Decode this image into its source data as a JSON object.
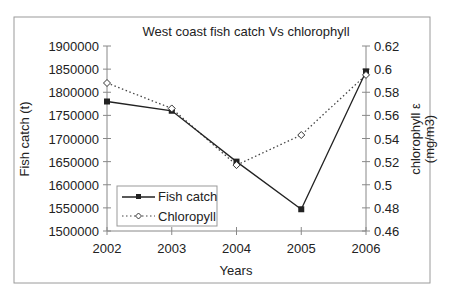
{
  "chart_data": {
    "type": "line",
    "title": "West coast fish catch Vs chlorophyll",
    "xlabel": "Years",
    "ylabel": "Fish catch (t)",
    "y2label_line1": "chlorophyll ε",
    "y2label_line2": "(mg/m3)",
    "categories": [
      "2002",
      "2003",
      "2004",
      "2005",
      "2006"
    ],
    "ylim": [
      1500000,
      1900000
    ],
    "yticks": [
      "1500000",
      "1550000",
      "1600000",
      "1650000",
      "1700000",
      "1750000",
      "1800000",
      "1850000",
      "1900000"
    ],
    "y2lim": [
      0.46,
      0.62
    ],
    "y2ticks": [
      "0.46",
      "0.48",
      "0.5",
      "0.52",
      "0.54",
      "0.56",
      "0.58",
      "0.6",
      "0.62"
    ],
    "grid": false,
    "legend_position": "bottom-left",
    "series": [
      {
        "name": "Fish catch",
        "axis": "left",
        "style": "solid",
        "marker": "filled-square",
        "values": [
          1780000,
          1760000,
          1650000,
          1547000,
          1845000
        ]
      },
      {
        "name": "Chloropyll",
        "axis": "right",
        "style": "dotted",
        "marker": "open-diamond",
        "values": [
          0.588,
          0.566,
          0.517,
          0.543,
          0.595
        ]
      }
    ]
  }
}
